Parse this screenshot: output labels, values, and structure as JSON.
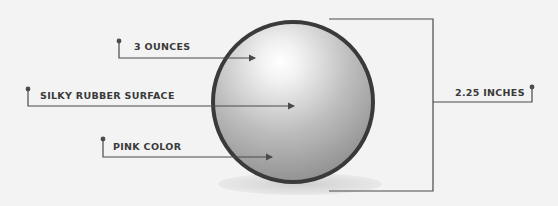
{
  "diagram": {
    "labels": {
      "weight": "3 OUNCES",
      "surface": "SILKY RUBBER SURFACE",
      "color": "PINK COLOR",
      "diameter": "2.25 INCHES"
    },
    "colors": {
      "background": "#f3f3f3",
      "line": "#4a4a4a",
      "ball_outline": "#3a3a3a",
      "ball_light": "#ffffff",
      "ball_dark": "#8c8c8c",
      "shadow": "#d6d6d6"
    }
  }
}
